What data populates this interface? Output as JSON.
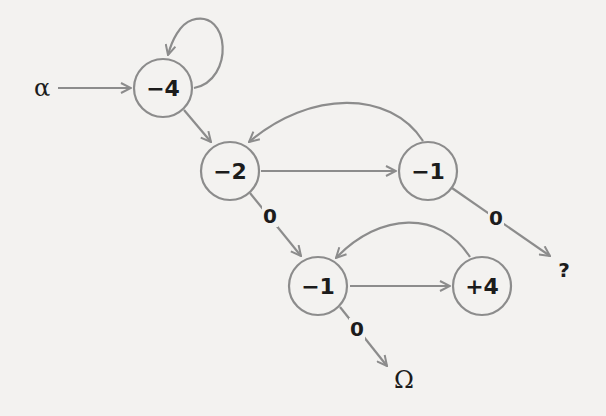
{
  "diagram": {
    "type": "state-transition-graph",
    "colors": {
      "background": "#f3f2f0",
      "edge": "#8c8c8c",
      "text": "#1c1c1c"
    },
    "start": {
      "label": "α"
    },
    "nodes": [
      {
        "id": "n1",
        "label": "−4"
      },
      {
        "id": "n2",
        "label": "−2"
      },
      {
        "id": "n3",
        "label": "−1"
      },
      {
        "id": "n4",
        "label": "−1"
      },
      {
        "id": "n5",
        "label": "+4"
      }
    ],
    "terminals": [
      {
        "id": "omega",
        "label": "Ω"
      },
      {
        "id": "unknown",
        "label": "?"
      }
    ],
    "edges": [
      {
        "from": "start",
        "to": "n1",
        "label": ""
      },
      {
        "from": "n1",
        "to": "n1",
        "label": ""
      },
      {
        "from": "n1",
        "to": "n2",
        "label": ""
      },
      {
        "from": "n2",
        "to": "n3",
        "label": ""
      },
      {
        "from": "n3",
        "to": "n2",
        "label": ""
      },
      {
        "from": "n2",
        "to": "n4",
        "label": "0"
      },
      {
        "from": "n3",
        "to": "unknown",
        "label": "0"
      },
      {
        "from": "n4",
        "to": "n5",
        "label": ""
      },
      {
        "from": "n5",
        "to": "n4",
        "label": ""
      },
      {
        "from": "n4",
        "to": "omega",
        "label": "0"
      }
    ]
  }
}
